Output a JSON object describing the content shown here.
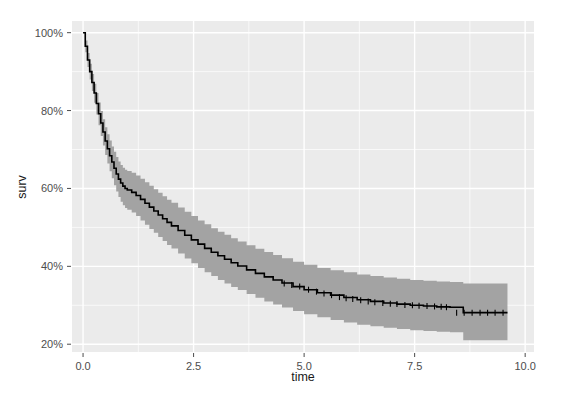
{
  "chart_data": {
    "type": "line",
    "title": "",
    "subtitle": "",
    "xlabel": "time",
    "ylabel": "surv",
    "xlim": [
      -0.25,
      10.2
    ],
    "ylim": [
      0.18,
      1.03
    ],
    "xticks": [
      0.0,
      2.5,
      5.0,
      7.5,
      10.0
    ],
    "xticklabels": [
      "0.0",
      "2.5",
      "5.0",
      "7.5",
      "10.0"
    ],
    "yticks": [
      0.2,
      0.4,
      0.6,
      0.8,
      1.0
    ],
    "yticklabels": [
      "20%",
      "40%",
      "60%",
      "80%",
      "100%"
    ],
    "grid": true,
    "grid_major": true,
    "grid_minor": true,
    "legend": "none",
    "panel_background": "#ebebeb",
    "grid_color": "#ffffff",
    "line_color": "#000000",
    "band_color": "#a3a3a3",
    "band_label": "95% confidence interval",
    "curve_style": "step",
    "censor_marks": true,
    "series": [
      {
        "name": "surv",
        "x": [
          0.0,
          0.05,
          0.1,
          0.15,
          0.2,
          0.25,
          0.3,
          0.35,
          0.4,
          0.45,
          0.5,
          0.55,
          0.6,
          0.65,
          0.7,
          0.75,
          0.8,
          0.85,
          0.9,
          0.95,
          1.0,
          1.1,
          1.2,
          1.3,
          1.4,
          1.5,
          1.6,
          1.7,
          1.8,
          1.9,
          2.0,
          2.15,
          2.3,
          2.45,
          2.6,
          2.75,
          2.9,
          3.05,
          3.2,
          3.35,
          3.5,
          3.7,
          3.9,
          4.1,
          4.3,
          4.5,
          4.75,
          5.0,
          5.3,
          5.6,
          5.9,
          6.2,
          6.5,
          6.8,
          7.1,
          7.4,
          7.7,
          8.0,
          8.3,
          8.6,
          9.0,
          9.3,
          9.6
        ],
        "y": [
          1.0,
          0.965,
          0.93,
          0.9,
          0.872,
          0.845,
          0.818,
          0.792,
          0.768,
          0.745,
          0.722,
          0.702,
          0.684,
          0.668,
          0.652,
          0.637,
          0.624,
          0.614,
          0.606,
          0.6,
          0.596,
          0.59,
          0.582,
          0.572,
          0.562,
          0.552,
          0.542,
          0.532,
          0.522,
          0.513,
          0.504,
          0.492,
          0.48,
          0.468,
          0.457,
          0.446,
          0.436,
          0.427,
          0.418,
          0.409,
          0.401,
          0.391,
          0.382,
          0.373,
          0.365,
          0.357,
          0.348,
          0.34,
          0.332,
          0.326,
          0.32,
          0.314,
          0.31,
          0.306,
          0.303,
          0.3,
          0.298,
          0.296,
          0.295,
          0.281,
          0.281,
          0.281,
          0.281
        ],
        "lower": [
          1.0,
          0.95,
          0.912,
          0.88,
          0.85,
          0.82,
          0.79,
          0.762,
          0.735,
          0.71,
          0.686,
          0.664,
          0.644,
          0.626,
          0.608,
          0.592,
          0.578,
          0.566,
          0.557,
          0.55,
          0.545,
          0.538,
          0.529,
          0.518,
          0.507,
          0.496,
          0.486,
          0.475,
          0.465,
          0.455,
          0.446,
          0.433,
          0.42,
          0.408,
          0.396,
          0.385,
          0.375,
          0.365,
          0.356,
          0.347,
          0.339,
          0.329,
          0.319,
          0.31,
          0.302,
          0.294,
          0.285,
          0.277,
          0.269,
          0.262,
          0.256,
          0.25,
          0.246,
          0.242,
          0.239,
          0.236,
          0.234,
          0.232,
          0.231,
          0.21,
          0.21,
          0.21,
          0.21
        ],
        "upper": [
          1.0,
          0.98,
          0.948,
          0.92,
          0.894,
          0.869,
          0.845,
          0.821,
          0.799,
          0.778,
          0.757,
          0.739,
          0.723,
          0.708,
          0.694,
          0.681,
          0.669,
          0.66,
          0.653,
          0.648,
          0.645,
          0.64,
          0.633,
          0.625,
          0.616,
          0.607,
          0.598,
          0.589,
          0.58,
          0.571,
          0.563,
          0.551,
          0.54,
          0.529,
          0.518,
          0.508,
          0.498,
          0.489,
          0.481,
          0.472,
          0.464,
          0.454,
          0.445,
          0.437,
          0.429,
          0.421,
          0.412,
          0.404,
          0.396,
          0.39,
          0.385,
          0.379,
          0.375,
          0.371,
          0.368,
          0.365,
          0.363,
          0.361,
          0.36,
          0.356,
          0.356,
          0.356,
          0.356
        ],
        "censor_x": [
          4.55,
          4.72,
          4.9,
          5.1,
          5.28,
          5.45,
          5.62,
          5.8,
          5.95,
          6.1,
          6.28,
          6.45,
          6.6,
          6.78,
          6.95,
          7.1,
          7.28,
          7.45,
          7.6,
          7.78,
          7.95,
          8.1,
          8.22,
          8.45,
          8.62,
          8.8,
          8.98,
          9.15,
          9.32,
          9.5
        ],
        "censor_y": [
          0.356,
          0.352,
          0.348,
          0.34,
          0.335,
          0.33,
          0.326,
          0.321,
          0.318,
          0.316,
          0.313,
          0.31,
          0.308,
          0.306,
          0.304,
          0.303,
          0.301,
          0.3,
          0.299,
          0.298,
          0.297,
          0.296,
          0.295,
          0.281,
          0.281,
          0.281,
          0.281,
          0.281,
          0.281,
          0.281
        ]
      }
    ]
  },
  "axes": {
    "x_title": "time",
    "y_title": "surv"
  }
}
